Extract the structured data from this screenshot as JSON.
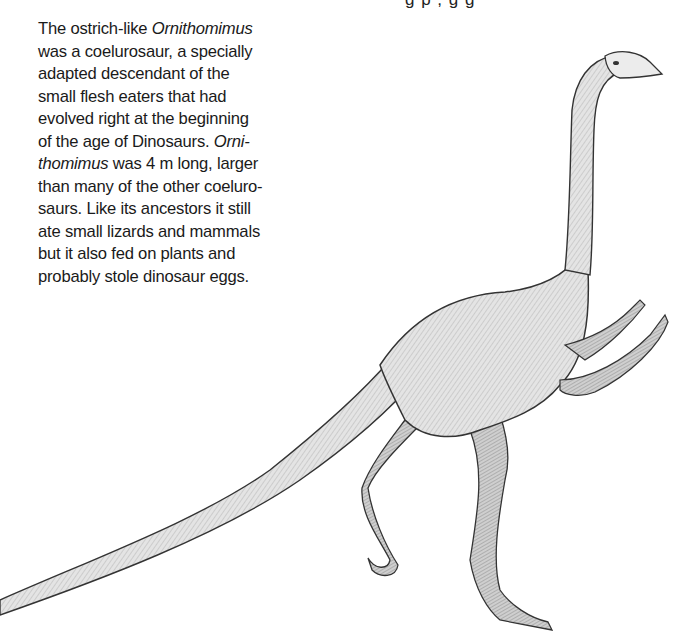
{
  "page": {
    "top_fragment": "g p    ,         g  g"
  },
  "caption": {
    "lines": [
      [
        {
          "t": "The ostrich-like "
        },
        {
          "t": "Ornithomimus",
          "i": true
        }
      ],
      [
        {
          "t": "was a coelurosaur, a specially"
        }
      ],
      [
        {
          "t": "adapted descendant of the"
        }
      ],
      [
        {
          "t": "small flesh eaters that had"
        }
      ],
      [
        {
          "t": "evolved right at the beginning"
        }
      ],
      [
        {
          "t": "of the age of Dinosaurs. "
        },
        {
          "t": "Orni-",
          "i": true
        }
      ],
      [
        {
          "t": "thomimus",
          "i": true
        },
        {
          "t": " was 4 m long, larger"
        }
      ],
      [
        {
          "t": "than many of the other coeluro-"
        }
      ],
      [
        {
          "t": "saurs. Like its ancestors it still"
        }
      ],
      [
        {
          "t": "ate small lizards and mammals"
        }
      ],
      [
        {
          "t": "but it also fed on plants and"
        }
      ],
      [
        {
          "t": "probably stole dinosaur eggs."
        }
      ]
    ]
  },
  "illustration": {
    "subject": "Ornithomimus",
    "style": "pencil-sketch",
    "ink_color": "#3a3a3a",
    "fill_color": "#d9d9d9"
  }
}
